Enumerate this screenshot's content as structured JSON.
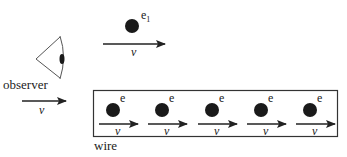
{
  "diagram": {
    "observer_label": "observer",
    "observer_velocity": "v",
    "free_electron": {
      "label": "e",
      "subscript": "1",
      "velocity": "v"
    },
    "wire_label": "wire",
    "wire_electrons": [
      {
        "label": "e",
        "velocity": "v"
      },
      {
        "label": "e",
        "velocity": "v"
      },
      {
        "label": "e",
        "velocity": "v"
      },
      {
        "label": "e",
        "velocity": "v"
      },
      {
        "label": "e",
        "velocity": "v"
      }
    ],
    "colors": {
      "ink": "#1a1a1a",
      "line": "#333333",
      "eye_outline": "#555555"
    }
  }
}
